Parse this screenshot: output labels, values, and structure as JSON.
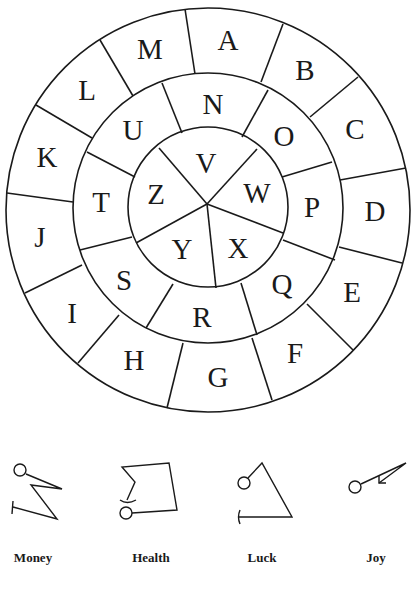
{
  "wheel": {
    "outer_ring": [
      "A",
      "B",
      "C",
      "D",
      "E",
      "F",
      "G",
      "H",
      "I",
      "J",
      "K",
      "L",
      "M"
    ],
    "middle_ring": [
      "N",
      "O",
      "P",
      "Q",
      "R",
      "S",
      "T",
      "U"
    ],
    "inner_ring": [
      "V",
      "W",
      "X",
      "Y",
      "Z"
    ]
  },
  "letters": {
    "A": "A",
    "B": "B",
    "C": "C",
    "D": "D",
    "E": "E",
    "F": "F",
    "G": "G",
    "H": "H",
    "I": "I",
    "J": "J",
    "K": "K",
    "L": "L",
    "M": "M",
    "N": "N",
    "O": "O",
    "P": "P",
    "Q": "Q",
    "R": "R",
    "S": "S",
    "T": "T",
    "U": "U",
    "V": "V",
    "W": "W",
    "X": "X",
    "Y": "Y",
    "Z": "Z"
  },
  "sigils": [
    {
      "icon": "money-sigil-icon",
      "label": "Money"
    },
    {
      "icon": "health-sigil-icon",
      "label": "Health"
    },
    {
      "icon": "luck-sigil-icon",
      "label": "Luck"
    },
    {
      "icon": "joy-sigil-icon",
      "label": "Joy"
    }
  ],
  "colors": {
    "ink": "#1a1a1a",
    "background": "#ffffff"
  }
}
